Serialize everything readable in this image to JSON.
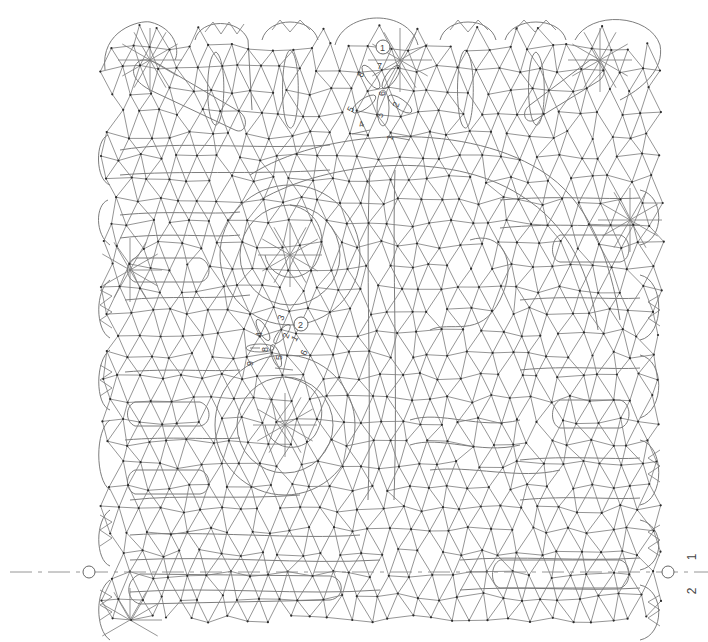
{
  "diagram": {
    "type": "bobbin-lace-pricking",
    "colors": {
      "line": "#7a7a7a",
      "pin": "#2a2a2a",
      "label": "#444444",
      "background": "#ffffff"
    },
    "start_markers": [
      {
        "id": "1",
        "label": "1",
        "cx": 383,
        "cy": 47,
        "petal_labels": [
          "1",
          "2",
          "3",
          "4",
          "5",
          "6",
          "7",
          "8"
        ]
      },
      {
        "id": "2",
        "label": "2",
        "cx": 301,
        "cy": 324,
        "petal_labels": [
          "1",
          "2",
          "3",
          "4",
          "5",
          "6",
          "7",
          "8",
          "9"
        ]
      }
    ],
    "center_line": {
      "y": 572,
      "left_marker": "○",
      "right_marker": "○",
      "right_labels": [
        "1",
        "2"
      ]
    }
  }
}
